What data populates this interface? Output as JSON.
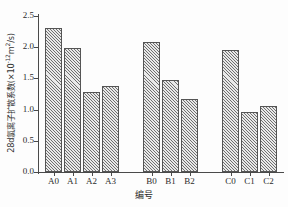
{
  "chart_data": {
    "type": "bar",
    "title": "",
    "subtitle": "",
    "xlabel": "编号",
    "ylabel": "28d氯离子扩散系数(×10-12m2/s)",
    "ylabel_prefix": "28d氯离子扩散系数(×10",
    "ylabel_exp": "-12",
    "ylabel_mid": "m",
    "ylabel_exp2": "2",
    "ylabel_suffix": "/s)",
    "categories": [
      "A0",
      "A1",
      "A2",
      "A3",
      "B0",
      "B1",
      "B2",
      "C0",
      "C1",
      "C2"
    ],
    "values": [
      2.3,
      1.99,
      1.28,
      1.38,
      2.08,
      1.47,
      1.17,
      1.96,
      0.96,
      1.06
    ],
    "groups": [
      {
        "name": "A",
        "categories": [
          "A0",
          "A1",
          "A2",
          "A3"
        ],
        "values": [
          2.3,
          1.99,
          1.28,
          1.38
        ]
      },
      {
        "name": "B",
        "categories": [
          "B0",
          "B1",
          "B2"
        ],
        "values": [
          2.08,
          1.47,
          1.17
        ]
      },
      {
        "name": "C",
        "categories": [
          "C0",
          "C1",
          "C2"
        ],
        "values": [
          1.96,
          0.96,
          1.06
        ]
      }
    ],
    "ylim": [
      0.0,
      2.5
    ],
    "yticks": [
      0.0,
      0.5,
      1.0,
      1.5,
      2.0,
      2.5
    ],
    "ytick_labels": [
      "0.0",
      "0.5",
      "1.0",
      "1.5",
      "2.0",
      "2.5"
    ],
    "grid": false,
    "legend": null,
    "bar_fill": "#e9e9e9",
    "bar_edge": "#555555",
    "bar_hatch": "cross-hatch",
    "axis_color": "#4a4a4a",
    "background": "#fdfdfd"
  }
}
